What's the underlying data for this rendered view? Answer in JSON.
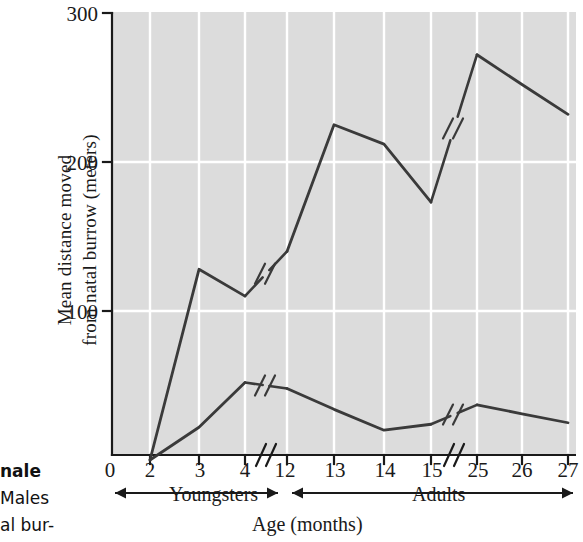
{
  "chart_data": {
    "type": "line",
    "title": "",
    "xlabel": "Age (months)",
    "ylabel": "Mean distance moved from natal burrow (meters)",
    "ylabel_line1": "Mean distance moved",
    "ylabel_line2": "from natal burrow (meters)",
    "ylim": [
      0,
      300
    ],
    "yticks": [
      0,
      100,
      200,
      300
    ],
    "ytick_labels": [
      "100",
      "200",
      "300"
    ],
    "xtick_labels": [
      "0",
      "2",
      "3",
      "4",
      "12",
      "13",
      "14",
      "15",
      "25",
      "26",
      "27"
    ],
    "x_axis_breaks": [
      "between 4 and 12",
      "between 15 and 25"
    ],
    "grid": "white gridlines on gray plot background",
    "legend": "inline series labels",
    "series": [
      {
        "name": "Males",
        "label": "Males",
        "x": [
          2,
          3,
          4,
          12,
          13,
          14,
          15,
          25,
          26,
          27
        ],
        "values": [
          0,
          128,
          110,
          140,
          225,
          212,
          173,
          272,
          252,
          232
        ],
        "has_break_marker_between": [
          [
            4,
            12
          ],
          [
            15,
            25
          ]
        ]
      },
      {
        "name": "Females",
        "label": "Females",
        "x": [
          2,
          3,
          4,
          12,
          13,
          14,
          15,
          25,
          26,
          27
        ],
        "values": [
          0,
          22,
          52,
          48,
          34,
          20,
          24,
          37,
          31,
          25
        ],
        "has_break_marker_between": [
          [
            4,
            12
          ],
          [
            15,
            25
          ]
        ]
      }
    ],
    "annotations": [
      {
        "text": "Youngsters",
        "role": "x-range-bracket",
        "covers": "0 to 12 months"
      },
      {
        "text": "Adults",
        "role": "x-range-bracket",
        "covers": "12 to 27 months"
      }
    ],
    "colors": {
      "plot_background": "#dcdcdc",
      "gridline": "#ffffff",
      "line": "#3a3a3a",
      "axis": "#1a1a1a",
      "text": "#1a1a1a",
      "page_background": "#ffffff"
    }
  },
  "caption_fragment": {
    "line1": "nale",
    "line2": "Males",
    "line3": "al bur-"
  }
}
